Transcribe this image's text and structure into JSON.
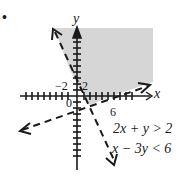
{
  "figure": {
    "bullet": "•",
    "axes": {
      "x_label": "x",
      "y_label": "y",
      "tick_labels": {
        "neg2": "−2",
        "pos2": "2",
        "origin": "0",
        "six": "6"
      }
    },
    "inequalities": [
      {
        "text": "2x + y > 2",
        "boundary": "2x + y = 2",
        "line_style": "dashed"
      },
      {
        "text": "x − 3y < 6",
        "boundary": "x − 3y = 6",
        "line_style": "dashed"
      }
    ],
    "shaded_region": {
      "description": "Region satisfying both 2x + y > 2 and x − 3y < 6",
      "color": "#cfcfcf"
    },
    "colors": {
      "ink": "#1a1a1a",
      "shade": "#cfcfcf",
      "background": "#ffffff"
    }
  }
}
